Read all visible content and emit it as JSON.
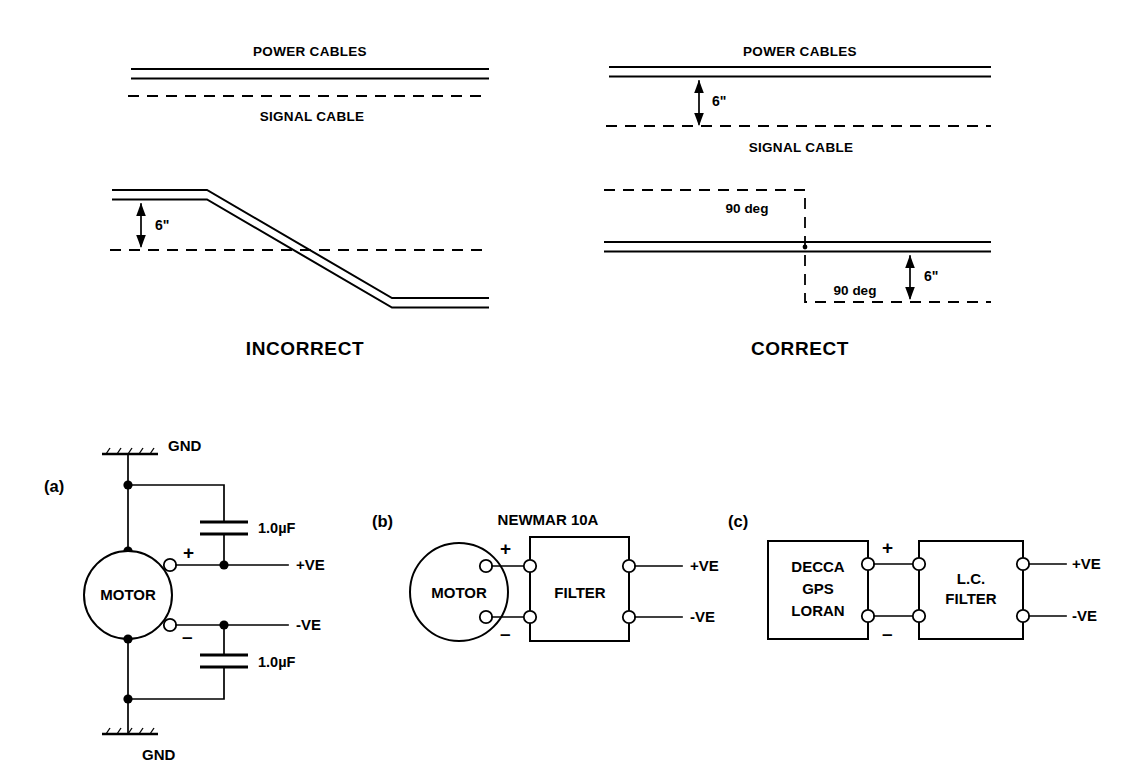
{
  "figure": {
    "title_top": "Cable routing: power vs signal cable separation",
    "title_bottom": "Motor and receiver noise-suppression wiring"
  },
  "top_panels": {
    "left": {
      "verdict": "INCORRECT",
      "upper": {
        "power_label": "POWER CABLES",
        "signal_label": "SIGNAL CABLE"
      },
      "lower": {
        "dimension": "6\""
      }
    },
    "right": {
      "verdict": "CORRECT",
      "upper": {
        "power_label": "POWER CABLES",
        "signal_label": "SIGNAL CABLE",
        "dimension": "6\""
      },
      "lower": {
        "angle_top": "90 deg",
        "angle_bottom": "90 deg",
        "dimension": "6\""
      }
    }
  },
  "circuits": [
    {
      "key": "a",
      "tag": "(a)",
      "source_label": "MOTOR",
      "ground_top": "GND",
      "ground_bottom": "GND",
      "cap_top_value": "1.0µF",
      "cap_bottom_value": "1.0µF",
      "terminal_plus": "+",
      "terminal_minus": "–",
      "out_plus": "+VE",
      "out_minus": "-VE"
    },
    {
      "key": "b",
      "tag": "(b)",
      "source_label": "MOTOR",
      "device_title": "NEWMAR 10A",
      "device_label": "FILTER",
      "terminal_plus": "+",
      "terminal_minus": "–",
      "out_plus": "+VE",
      "out_minus": "-VE"
    },
    {
      "key": "c",
      "tag": "(c)",
      "source_lines": [
        "DECCA",
        "GPS",
        "LORAN"
      ],
      "device_lines": [
        "L.C.",
        "FILTER"
      ],
      "terminal_plus": "+",
      "terminal_minus": "–",
      "out_plus": "+VE",
      "out_minus": "-VE"
    }
  ],
  "colors": {
    "ink": "#000000",
    "paper": "#ffffff"
  }
}
